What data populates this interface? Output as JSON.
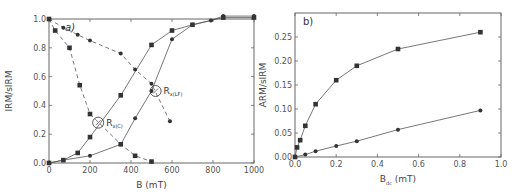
{
  "chart_data": [
    {
      "panel": "a)",
      "type": "line",
      "title": "",
      "xlabel": "B (mT)",
      "ylabel": "IRM/sIRM",
      "xlim": [
        0,
        1000
      ],
      "ylim": [
        0,
        1.0
      ],
      "xticks": [
        0,
        200,
        400,
        600,
        800,
        1000
      ],
      "yticks": [
        0.0,
        0.2,
        0.4,
        0.6,
        0.8,
        1.0
      ],
      "xtick_labels": [
        "0",
        "200",
        "400",
        "600",
        "800",
        "1000"
      ],
      "ytick_labels": [
        "0.0",
        "0.2",
        "0.4",
        "0.6",
        "0.8",
        "1.0"
      ],
      "grid": false,
      "legend": null,
      "series": [
        {
          "name": "IRM acquisition (squares)",
          "marker": "square",
          "linestyle": "solid",
          "x": [
            0,
            70,
            140,
            200,
            350,
            500,
            600,
            700,
            850,
            1000
          ],
          "y": [
            0.0,
            0.02,
            0.07,
            0.18,
            0.47,
            0.82,
            0.92,
            0.96,
            1.01,
            1.01
          ]
        },
        {
          "name": "IRM acquisition (circles)",
          "marker": "circle",
          "linestyle": "solid",
          "x": [
            0,
            70,
            200,
            350,
            420,
            500,
            600,
            700,
            790,
            850,
            1000
          ],
          "y": [
            0.0,
            0.02,
            0.05,
            0.13,
            0.31,
            0.5,
            0.86,
            0.96,
            0.99,
            1.02,
            1.02
          ]
        },
        {
          "name": "AF demagnetization (squares)",
          "marker": "square",
          "linestyle": "dashed",
          "x": [
            0,
            30,
            100,
            150,
            200,
            350,
            420,
            500
          ],
          "y": [
            1.0,
            0.92,
            0.8,
            0.54,
            0.34,
            0.13,
            0.05,
            0.01
          ]
        },
        {
          "name": "AF demagnetization (circles)",
          "marker": "circle",
          "linestyle": "dashed",
          "x": [
            0,
            70,
            140,
            200,
            350,
            420,
            500,
            590
          ],
          "y": [
            1.0,
            0.94,
            0.89,
            0.85,
            0.76,
            0.65,
            0.55,
            0.29
          ]
        }
      ],
      "annotations": [
        {
          "text": "R",
          "subscript": "x(C)",
          "x": 240,
          "y": 0.28
        },
        {
          "text": "R",
          "subscript": "x(LF)",
          "x": 520,
          "y": 0.5
        }
      ]
    },
    {
      "panel": "b)",
      "type": "line",
      "title": "",
      "xlabel": "B",
      "xlabel_subscript": "dc",
      "xlabel_unit": "(mT)",
      "ylabel": "ARM/sIRM",
      "xlim": [
        0,
        1.0
      ],
      "ylim": [
        0,
        0.3
      ],
      "xticks": [
        0.0,
        0.2,
        0.4,
        0.6,
        0.8,
        1.0
      ],
      "yticks": [
        0.0,
        0.05,
        0.1,
        0.15,
        0.2,
        0.25
      ],
      "xtick_labels": [
        "0.0",
        "0.2",
        "0.4",
        "0.6",
        "0.8",
        "1.0"
      ],
      "ytick_labels": [
        "0.00",
        "0.05",
        "0.10",
        "0.15",
        "0.20",
        "0.25"
      ],
      "grid": false,
      "legend": null,
      "series": [
        {
          "name": "squares",
          "marker": "square",
          "linestyle": "solid",
          "x": [
            0,
            0.01,
            0.025,
            0.05,
            0.1,
            0.2,
            0.3,
            0.5,
            0.9
          ],
          "y": [
            0.0,
            0.02,
            0.035,
            0.065,
            0.11,
            0.16,
            0.19,
            0.225,
            0.26
          ]
        },
        {
          "name": "circles",
          "marker": "circle",
          "linestyle": "solid",
          "x": [
            0,
            0.05,
            0.1,
            0.2,
            0.3,
            0.5,
            0.9
          ],
          "y": [
            0.0,
            0.005,
            0.012,
            0.023,
            0.033,
            0.057,
            0.097
          ]
        }
      ]
    }
  ],
  "style": {
    "line_color": "#555555",
    "marker_color": "#333333",
    "axis_color": "#666666",
    "text_color": "#555555"
  }
}
